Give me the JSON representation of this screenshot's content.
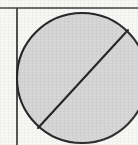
{
  "figure": {
    "kind": "geometric-diagram",
    "canvas": {
      "width": 138,
      "height": 145
    },
    "background": {
      "paper_color": "#f7f7f5",
      "texture": "scanned-paper-grain"
    },
    "colors": {
      "ink": "#2a2a2a",
      "rule_line": "#3a3a3a",
      "circle_fill": "#d6d6d6",
      "circle_stroke": "#262626",
      "chord_stroke": "#262626",
      "paper": "#f7f7f5"
    },
    "rules": [
      {
        "name": "horizontal-rule",
        "orientation": "horizontal",
        "y": 8,
        "x1": 0,
        "x2": 138,
        "stroke_width": 1.6,
        "color": "#3a3a3a"
      },
      {
        "name": "vertical-rule",
        "orientation": "vertical",
        "x": 17,
        "y1": 8,
        "y2": 145,
        "stroke_width": 1.8,
        "color": "#3a3a3a"
      }
    ],
    "circle": {
      "name": "filled-circle",
      "center_x": 82,
      "center_y": 78,
      "radius": 65,
      "fill": "#d6d6d6",
      "stroke": "#262626",
      "stroke_width": 2.1,
      "clipped_edges": [
        "right",
        "bottom"
      ]
    },
    "chord": {
      "name": "diagonal-chord",
      "x1": 38,
      "y1": 128,
      "x2": 128,
      "y2": 30,
      "angle_degrees": 45,
      "stroke": "#262626",
      "stroke_width": 2.1
    },
    "labels": []
  }
}
